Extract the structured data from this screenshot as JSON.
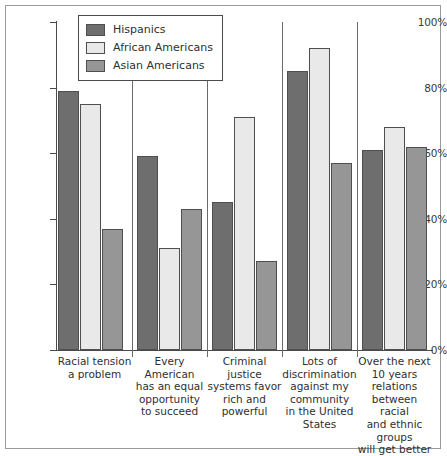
{
  "chart_data": {
    "type": "bar",
    "title": "",
    "subtitle": "",
    "xlabel": "",
    "ylabel": "",
    "ylim": [
      0,
      100
    ],
    "yticks": [
      0,
      20,
      40,
      60,
      80,
      100
    ],
    "ytick_labels": [
      "0%",
      "20%",
      "40%",
      "60%",
      "80%",
      "100%"
    ],
    "grid": false,
    "legend_position": "top-left",
    "categories": [
      "Racial tension a problem",
      "Every American has an equal opportunity to succeed",
      "Criminal justice systems favor rich and powerful",
      "Lots of discrimination against my community in the United States",
      "Over the next 10 years relations between racial and ethnic groups will get better"
    ],
    "category_lines": [
      [
        "Racial tension",
        "a problem"
      ],
      [
        "Every American",
        "has an equal",
        "opportunity",
        "to succeed"
      ],
      [
        "Criminal",
        "justice",
        "systems favor",
        "rich and",
        "powerful"
      ],
      [
        "Lots of",
        "discrimination",
        "against my",
        "community",
        "in the United",
        "States"
      ],
      [
        "Over the next",
        "10 years",
        "relations",
        "between racial",
        "and ethnic",
        "groups",
        "will get better"
      ]
    ],
    "series": [
      {
        "name": "Hispanics",
        "color": "#6e6e6e",
        "values": [
          79,
          59,
          45,
          85,
          61
        ]
      },
      {
        "name": "African Americans",
        "color": "#e9e9e9",
        "values": [
          75,
          31,
          71,
          92,
          68
        ]
      },
      {
        "name": "Asian Americans",
        "color": "#969696",
        "values": [
          37,
          43,
          27,
          57,
          62
        ]
      }
    ]
  },
  "legend": {
    "items": [
      {
        "label": "Hispanics",
        "color": "#6e6e6e"
      },
      {
        "label": "African Americans",
        "color": "#e9e9e9"
      },
      {
        "label": "Asian Americans",
        "color": "#969696"
      }
    ]
  }
}
